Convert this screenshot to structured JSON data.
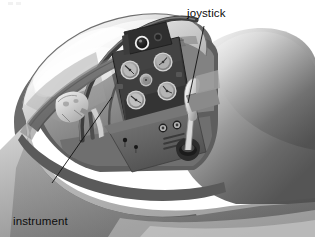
{
  "illustration": {
    "subject": "aircraft cockpit cutaway",
    "style": "grayscale airbrush technical illustration",
    "background_color": "#ffffff"
  },
  "annotations": [
    {
      "id": "joystick",
      "label": "joystick",
      "leader_from": [
        204,
        26
      ],
      "leader_to": [
        188,
        103
      ],
      "target": "control-stick-grip"
    },
    {
      "id": "instrument-panel",
      "label_line_1": "instrument",
      "label_line_2": "panel",
      "leader_from": [
        52,
        183
      ],
      "leader_to": [
        112,
        97
      ],
      "target": "instrument-panel-face"
    }
  ],
  "parts": {
    "canopy": "canopy-glass-dome",
    "canopy_bow": "canopy-frame-bow",
    "fuselage": "fuselage-body",
    "cockpit_sill": "cockpit-coaming-rail",
    "instrument_panel": "instrument-panel-face",
    "gunsight": "gunsight-ring",
    "console": "lower-console",
    "joystick": "control-stick",
    "seat": "pilot-seat-cushion"
  },
  "instrument_panel": {
    "face_color": "#3b3b3b",
    "gauge_count": 5,
    "gauges": [
      {
        "id": "gauge-upper-left",
        "cx": 130,
        "cy": 70,
        "r": 9.5
      },
      {
        "id": "gauge-upper-right",
        "cx": 163,
        "cy": 62,
        "r": 9.5
      },
      {
        "id": "gauge-center",
        "cx": 146,
        "cy": 80,
        "r": 6.0
      },
      {
        "id": "gauge-lower-left",
        "cx": 136,
        "cy": 100,
        "r": 9.5
      },
      {
        "id": "gauge-lower-right",
        "cx": 167,
        "cy": 91,
        "r": 9.5
      }
    ],
    "gunsight": {
      "cx": 142,
      "cy": 45,
      "r": 6.5
    }
  },
  "console": {
    "knobs": [
      {
        "id": "console-knob-left",
        "cx": 163,
        "cy": 128,
        "r": 4.2
      },
      {
        "id": "console-knob-right",
        "cx": 177,
        "cy": 125,
        "r": 4.2
      }
    ],
    "switches": [
      {
        "id": "switch-left",
        "cx": 125,
        "cy": 142,
        "r": 2.0
      },
      {
        "id": "switch-right",
        "cx": 136,
        "cy": 148,
        "r": 1.8
      }
    ],
    "vent_slots": 3
  },
  "colors": {
    "ink": "#0d0d0d",
    "panel_dark": "#3b3b3b",
    "panel_darker": "#2a2a2a",
    "metal_light": "#e8e8e8",
    "metal_mid": "#9a9a9a",
    "metal_dark": "#4a4a4a",
    "highlight": "#f4f4f4",
    "joystick_grip": "#dcdcdc"
  }
}
